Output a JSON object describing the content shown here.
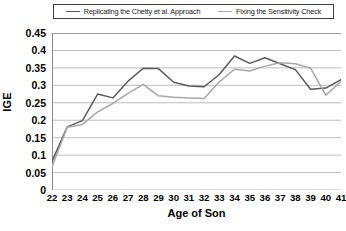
{
  "chart_data": {
    "type": "line",
    "title": "",
    "xlabel": "Age of Son",
    "ylabel": "IGE",
    "x": [
      22,
      23,
      24,
      25,
      26,
      27,
      28,
      29,
      30,
      31,
      32,
      33,
      34,
      35,
      36,
      37,
      38,
      39,
      40,
      41
    ],
    "categories": [
      "22",
      "23",
      "24",
      "25",
      "26",
      "27",
      "28",
      "29",
      "30",
      "31",
      "32",
      "33",
      "34",
      "35",
      "36",
      "37",
      "38",
      "39",
      "40",
      "41"
    ],
    "xlim": [
      22,
      41
    ],
    "ylim": [
      0,
      0.45
    ],
    "yticks": [
      "0",
      "0.05",
      "0.1",
      "0.15",
      "0.2",
      "0.25",
      "0.3",
      "0.35",
      "0.4",
      "0.45"
    ],
    "ytick_values": [
      0,
      0.05,
      0.1,
      0.15,
      0.2,
      0.25,
      0.3,
      0.35,
      0.4,
      0.45
    ],
    "grid": "horizontal",
    "legend_position": "top",
    "series": [
      {
        "name": "Replicating the Chetty et al. Approach",
        "color": "#5a5a5a",
        "values": [
          0.082,
          0.181,
          0.199,
          0.275,
          0.264,
          0.312,
          0.349,
          0.348,
          0.309,
          0.298,
          0.296,
          0.331,
          0.384,
          0.363,
          0.379,
          0.362,
          0.345,
          0.289,
          0.292,
          0.316
        ]
      },
      {
        "name": "Fixing the Sensitivity Check",
        "color": "#a8a8a8",
        "values": [
          0.066,
          0.18,
          0.188,
          0.224,
          0.248,
          0.277,
          0.303,
          0.27,
          0.266,
          0.264,
          0.262,
          0.31,
          0.346,
          0.341,
          0.355,
          0.365,
          0.362,
          0.349,
          0.272,
          0.311
        ]
      }
    ]
  },
  "axis": {
    "y_title": "IGE",
    "x_title": "Age of Son"
  }
}
